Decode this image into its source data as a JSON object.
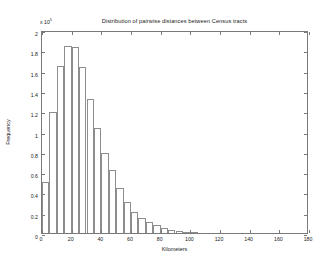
{
  "chart_data": {
    "type": "bar",
    "title": "Distribution of pairwise distances between Census tracts",
    "xlabel": "Kilometers",
    "ylabel": "Frequency",
    "y_exponent_label": "x 10",
    "y_exponent_power": "5",
    "y_scale_factor": 100000,
    "xlim": [
      0,
      180
    ],
    "ylim": [
      0,
      2
    ],
    "xticks": [
      0,
      20,
      40,
      60,
      80,
      100,
      120,
      140,
      160,
      180
    ],
    "xtick_labels": [
      "0",
      "20",
      "40",
      "60",
      "80",
      "100",
      "120",
      "140",
      "160",
      "180"
    ],
    "yticks": [
      0,
      0.2,
      0.4,
      0.6,
      0.8,
      1,
      1.2,
      1.4,
      1.6,
      1.8,
      2
    ],
    "ytick_labels": [
      "0",
      "0.2",
      "0.4",
      "0.6",
      "0.8",
      "1",
      "1.2",
      "1.4",
      "1.6",
      "1.8",
      "2"
    ],
    "grid": false,
    "legend": null,
    "bin_width": 5,
    "bin_centers": [
      2.5,
      7.5,
      12.5,
      17.5,
      22.5,
      27.5,
      32.5,
      37.5,
      42.5,
      47.5,
      52.5,
      57.5,
      62.5,
      67.5,
      72.5,
      77.5,
      82.5,
      87.5,
      92.5,
      97.5,
      102.5
    ],
    "categories": [
      "0-5",
      "5-10",
      "10-15",
      "15-20",
      "20-25",
      "25-30",
      "30-35",
      "35-40",
      "40-45",
      "45-50",
      "50-55",
      "55-60",
      "60-65",
      "65-70",
      "70-75",
      "75-80",
      "80-85",
      "85-90",
      "90-95",
      "95-100",
      "100-105"
    ],
    "values": [
      0.5,
      1.19,
      1.65,
      1.84,
      1.83,
      1.64,
      1.32,
      1.03,
      0.79,
      0.62,
      0.44,
      0.31,
      0.21,
      0.145,
      0.105,
      0.075,
      0.05,
      0.032,
      0.022,
      0.014,
      0.008
    ]
  }
}
